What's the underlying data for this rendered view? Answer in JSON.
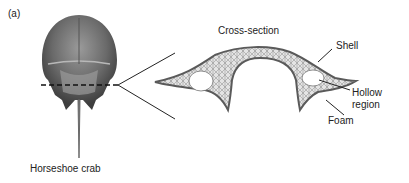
{
  "panel_label": "(a)",
  "crab_label": "Horseshoe crab",
  "section_title": "Cross-section",
  "callouts": {
    "shell": "Shell",
    "hollow_1": "Hollow",
    "hollow_2": "region",
    "foam": "Foam"
  },
  "colors": {
    "shell": "#5a5a5a",
    "foam_fill": "#d8d8d8",
    "crab_dark": "#4a4a4a",
    "crab_mid": "#8a8a8a",
    "line": "#222222"
  }
}
